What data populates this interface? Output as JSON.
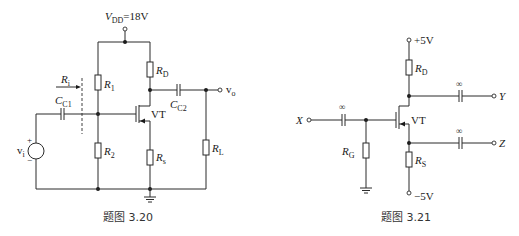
{
  "figures": [
    {
      "caption": "题图 3.20",
      "supply": {
        "symbol": "V",
        "sub": "DD",
        "value": "=18V"
      },
      "components": {
        "r1": {
          "symbol": "R",
          "sub": "1"
        },
        "r2": {
          "symbol": "R",
          "sub": "2"
        },
        "rd": {
          "symbol": "R",
          "sub": "D"
        },
        "rs": {
          "symbol": "R",
          "sub": "s"
        },
        "rl": {
          "symbol": "R",
          "sub": "L"
        },
        "cc1": {
          "symbol": "C",
          "sub": "C1"
        },
        "cc2": {
          "symbol": "C",
          "sub": "C2"
        },
        "ri": {
          "symbol": "R",
          "sub": "i"
        },
        "transistor": "VT",
        "source": {
          "symbol": "v",
          "sub": "i",
          "plus": "+",
          "minus": "−"
        },
        "output": {
          "symbol": "v",
          "sub": "o"
        }
      }
    },
    {
      "caption": "题图 3.21",
      "supply_pos": "+5V",
      "supply_neg": "−5V",
      "components": {
        "rd": {
          "symbol": "R",
          "sub": "D"
        },
        "rs": {
          "symbol": "R",
          "sub": "S"
        },
        "rg": {
          "symbol": "R",
          "sub": "G"
        },
        "transistor": "VT",
        "cap_label": "∞",
        "input": "X",
        "output_y": "Y",
        "output_z": "Z"
      }
    }
  ]
}
